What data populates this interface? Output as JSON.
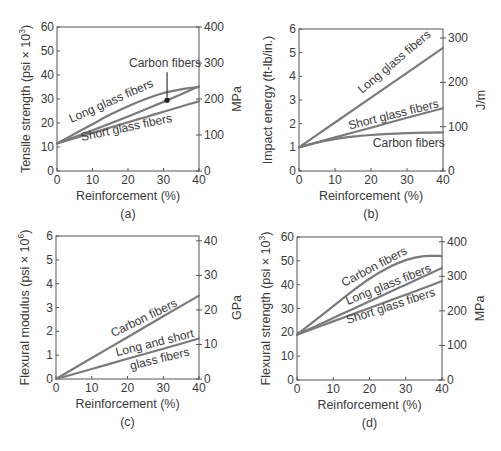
{
  "figure": {
    "line_color": "#7a7a7a",
    "axis_color": "#555555",
    "text_color": "#3a3a3a"
  },
  "chart_data": [
    {
      "id": "a",
      "type": "line",
      "panel_label": "(a)",
      "title": "",
      "xlabel": "Reinforcement (%)",
      "ylabel": "Tensile strength (psi × 10³)",
      "ylabel_parts": {
        "base": "Tensile strength (psi × 10",
        "sup": "3",
        "tail": ")"
      },
      "y2label": "MPa",
      "xlim": [
        0,
        40
      ],
      "ylim": [
        0,
        60
      ],
      "y2lim": [
        0,
        400
      ],
      "xticks": [
        0,
        10,
        20,
        30,
        40
      ],
      "yticks": [
        0,
        10,
        20,
        30,
        40,
        50,
        60
      ],
      "y2ticks": [
        0,
        100,
        200,
        300,
        400
      ],
      "grid": false,
      "legend": "inline labels",
      "series": [
        {
          "name": "Long glass fibers",
          "x": [
            0,
            5,
            10,
            15,
            20,
            25,
            30,
            35,
            40
          ],
          "y": [
            11.5,
            15.5,
            19.5,
            23.5,
            27,
            30,
            32.5,
            34,
            35
          ]
        },
        {
          "name": "Carbon fibers",
          "x": [
            0,
            5,
            10,
            15,
            20,
            25,
            30,
            35,
            40
          ],
          "y": [
            11.5,
            14.2,
            17,
            19.8,
            22.7,
            25.7,
            28.8,
            32,
            35.3
          ]
        },
        {
          "name": "Short glass fibers",
          "x": [
            0,
            5,
            10,
            15,
            20,
            25,
            30,
            35,
            40
          ],
          "y": [
            11.5,
            13.7,
            15.9,
            18.1,
            20.3,
            22.5,
            24.7,
            26.9,
            29
          ]
        }
      ],
      "annotations": [
        {
          "text": "Carbon fibers",
          "type": "arrow",
          "x": 31,
          "y": 29.5,
          "marker": "dot"
        },
        {
          "text": "Long glass fibers",
          "x": 4,
          "y": 20,
          "angle": -24
        },
        {
          "text": "Short glass fibers",
          "x": 7,
          "y": 12.5,
          "angle": -12
        }
      ]
    },
    {
      "id": "b",
      "type": "line",
      "panel_label": "(b)",
      "title": "",
      "xlabel": "Reinforcement (%)",
      "ylabel": "Impact energy (ft-lb/in.)",
      "y2label": "J/m",
      "xlim": [
        0,
        40
      ],
      "ylim": [
        0,
        6
      ],
      "y2lim": [
        0,
        320.3
      ],
      "xticks": [
        0,
        10,
        20,
        30,
        40
      ],
      "yticks": [
        0,
        1,
        2,
        3,
        4,
        5,
        6
      ],
      "y2ticks": [
        0,
        100,
        200,
        300
      ],
      "grid": false,
      "legend": "inline labels",
      "series": [
        {
          "name": "Long glass fibers",
          "x": [
            0,
            10,
            20,
            30,
            40
          ],
          "y": [
            1.0,
            2.05,
            3.1,
            4.15,
            5.2
          ]
        },
        {
          "name": "Short glass fibers",
          "x": [
            0,
            10,
            20,
            30,
            40
          ],
          "y": [
            1.0,
            1.42,
            1.83,
            2.25,
            2.65
          ]
        },
        {
          "name": "Carbon fibers",
          "x": [
            0,
            5,
            10,
            15,
            20,
            25,
            30,
            35,
            40
          ],
          "y": [
            1.0,
            1.2,
            1.35,
            1.45,
            1.52,
            1.57,
            1.6,
            1.62,
            1.63
          ]
        }
      ],
      "annotations": [
        {
          "text": "Long glass fibers",
          "x": 17.5,
          "y": 3.25,
          "angle": -40
        },
        {
          "text": "Short glass fibers",
          "x": 14,
          "y": 1.75,
          "angle": -14
        },
        {
          "text": "Carbon fibers",
          "x": 20.5,
          "y": 1.0,
          "angle": 0
        }
      ]
    },
    {
      "id": "c",
      "type": "line",
      "panel_label": "(c)",
      "title": "",
      "xlabel": "Reinforcement (%)",
      "ylabel": "Flexural modulus (psi × 10⁶)",
      "ylabel_parts": {
        "base": "Flexural modulus (psi × 10",
        "sup": "6",
        "tail": ")"
      },
      "y2label": "GPa",
      "xlim": [
        0,
        40
      ],
      "ylim": [
        0,
        6
      ],
      "y2lim": [
        0,
        41.4
      ],
      "xticks": [
        0,
        10,
        20,
        30,
        40
      ],
      "yticks": [
        0,
        1,
        2,
        3,
        4,
        5,
        6
      ],
      "y2ticks": [
        0,
        10,
        20,
        30,
        40
      ],
      "grid": false,
      "legend": "inline labels",
      "series": [
        {
          "name": "Carbon fibers",
          "x": [
            0,
            10,
            20,
            30,
            40
          ],
          "y": [
            0,
            0.88,
            1.75,
            2.63,
            3.5
          ]
        },
        {
          "name": "Long and short glass fibers",
          "x": [
            0,
            10,
            20,
            30,
            40
          ],
          "y": [
            0,
            0.42,
            0.85,
            1.27,
            1.7
          ]
        }
      ],
      "annotations": [
        {
          "text": "Carbon fibers",
          "x": 16,
          "y": 1.75,
          "angle": -26
        },
        {
          "text": "Long and short",
          "x": 17,
          "y": 0.95,
          "angle": -14
        },
        {
          "text": "glass fibers",
          "x": 21,
          "y": 0.38,
          "angle": -14
        }
      ]
    },
    {
      "id": "d",
      "type": "line",
      "panel_label": "(d)",
      "title": "",
      "xlabel": "Reinforcement (%)",
      "ylabel": "Flexural strength (psi × 10³)",
      "ylabel_parts": {
        "base": "Flexural strength (psi × 10",
        "sup": "3",
        "tail": ")"
      },
      "y2label": "MPa",
      "xlim": [
        0,
        40
      ],
      "ylim": [
        0,
        60
      ],
      "y2lim": [
        0,
        413.7
      ],
      "xticks": [
        0,
        10,
        20,
        30,
        40
      ],
      "yticks": [
        0,
        10,
        20,
        30,
        40,
        50,
        60
      ],
      "y2ticks": [
        0,
        100,
        200,
        300,
        400
      ],
      "grid": false,
      "legend": "inline labels",
      "series": [
        {
          "name": "Carbon fibers",
          "x": [
            0,
            5,
            10,
            15,
            20,
            25,
            30,
            35,
            40
          ],
          "y": [
            19,
            25,
            31,
            37,
            42.5,
            47,
            50.3,
            52,
            52
          ]
        },
        {
          "name": "Long glass fibers",
          "x": [
            0,
            5,
            10,
            15,
            20,
            25,
            30,
            35,
            40
          ],
          "y": [
            19,
            22.5,
            26,
            29.5,
            33,
            36.5,
            40,
            43.5,
            47
          ]
        },
        {
          "name": "Short glass fibers",
          "x": [
            0,
            5,
            10,
            15,
            20,
            25,
            30,
            35,
            40
          ],
          "y": [
            19,
            21.8,
            24.6,
            27.4,
            30.2,
            33,
            35.8,
            38.6,
            41.5
          ]
        }
      ],
      "annotations": [
        {
          "text": "Carbon fibers",
          "x": 13,
          "y": 39,
          "angle": -28
        },
        {
          "text": "Long glass fibers",
          "x": 14,
          "y": 31.5,
          "angle": -22
        },
        {
          "text": "Short glass fibers",
          "x": 14,
          "y": 23.5,
          "angle": -18
        }
      ]
    }
  ],
  "layout": {
    "panels": [
      {
        "id": "a",
        "left": 57,
        "top": 27,
        "right": 199,
        "bottom": 171
      },
      {
        "id": "b",
        "left": 299,
        "top": 29,
        "right": 443,
        "bottom": 171
      },
      {
        "id": "c",
        "left": 56,
        "top": 236,
        "right": 199,
        "bottom": 379
      },
      {
        "id": "d",
        "left": 297,
        "top": 237,
        "right": 442,
        "bottom": 380
      }
    ]
  }
}
